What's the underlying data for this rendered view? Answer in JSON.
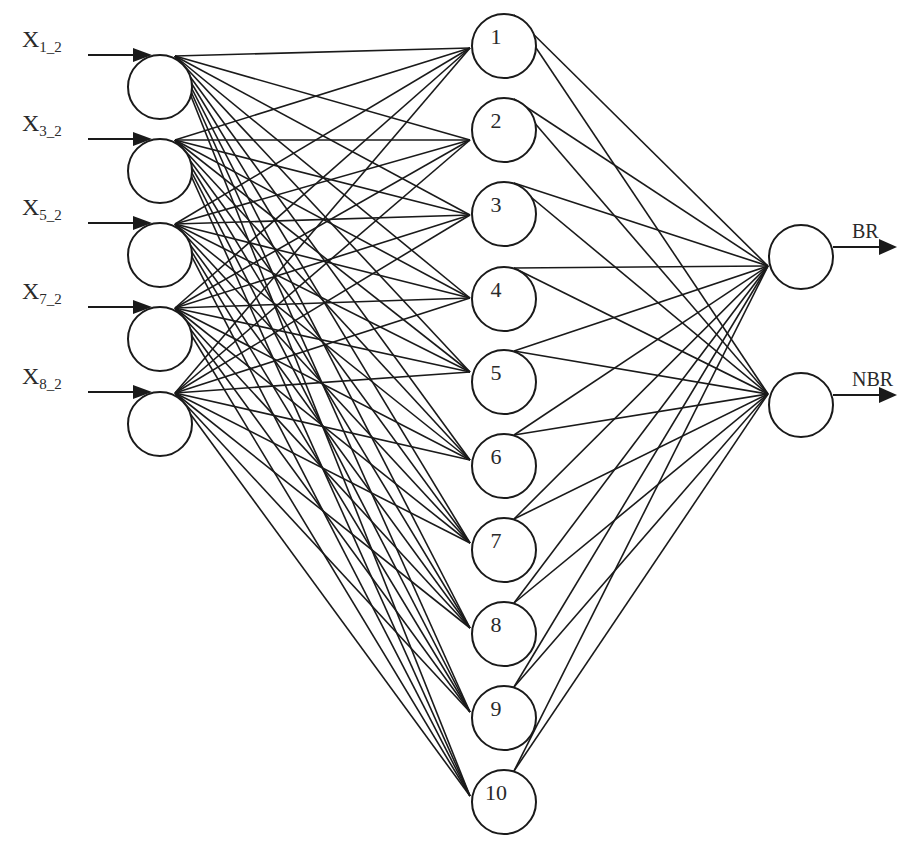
{
  "diagram": {
    "title": "",
    "colors": {
      "stroke": "#1a1a1a",
      "text": "#2a2a2a",
      "background": "#ffffff"
    },
    "input_layer": {
      "nodes": [
        {
          "id": "x1_2",
          "label_main": "X",
          "label_sub": "1_2",
          "cx": 160,
          "cy": 87,
          "fan_x": 175,
          "fan_y": 56,
          "arrow_y": 55
        },
        {
          "id": "x3_2",
          "label_main": "X",
          "label_sub": "3_2",
          "cx": 160,
          "cy": 171,
          "fan_x": 175,
          "fan_y": 140,
          "arrow_y": 139
        },
        {
          "id": "x5_2",
          "label_main": "X",
          "label_sub": "5_2",
          "cx": 160,
          "cy": 255,
          "fan_x": 175,
          "fan_y": 224,
          "arrow_y": 223
        },
        {
          "id": "x7_2",
          "label_main": "X",
          "label_sub": "7_2",
          "cx": 160,
          "cy": 339,
          "fan_x": 175,
          "fan_y": 308,
          "arrow_y": 307
        },
        {
          "id": "x8_2",
          "label_main": "X",
          "label_sub": "8_2",
          "cx": 160,
          "cy": 424,
          "fan_x": 175,
          "fan_y": 393,
          "arrow_y": 392
        }
      ]
    },
    "hidden_layer": {
      "nodes": [
        {
          "label": "1",
          "cx": 504,
          "cy": 46,
          "in_y": 48
        },
        {
          "label": "2",
          "cx": 504,
          "cy": 130,
          "in_y": 140
        },
        {
          "label": "3",
          "cx": 504,
          "cy": 214,
          "in_y": 215
        },
        {
          "label": "4",
          "cx": 504,
          "cy": 299,
          "in_y": 298
        },
        {
          "label": "5",
          "cx": 504,
          "cy": 382,
          "in_y": 372
        },
        {
          "label": "6",
          "cx": 504,
          "cy": 466,
          "in_y": 460
        },
        {
          "label": "7",
          "cx": 504,
          "cy": 550,
          "in_y": 543
        },
        {
          "label": "8",
          "cx": 504,
          "cy": 634,
          "in_y": 628
        },
        {
          "label": "9",
          "cx": 504,
          "cy": 718,
          "in_y": 712
        },
        {
          "label": "10",
          "cx": 504,
          "cy": 802,
          "in_y": 796
        }
      ]
    },
    "output_layer": {
      "nodes": [
        {
          "label": "BR",
          "cx": 801,
          "cy": 257,
          "in_x": 768,
          "in_y": 266,
          "arrow_y": 247
        },
        {
          "label": "NBR",
          "cx": 801,
          "cy": 405,
          "in_x": 768,
          "in_y": 394,
          "arrow_y": 395
        }
      ]
    },
    "geometry": {
      "radius": 32,
      "hidden_in_x": 470,
      "hidden_out_dx": 10,
      "arrow_in_x0": 88,
      "arrow_out_x1": 897
    },
    "connectivity": "fully-connected: 5 inputs -> 10 hidden -> 2 outputs"
  }
}
